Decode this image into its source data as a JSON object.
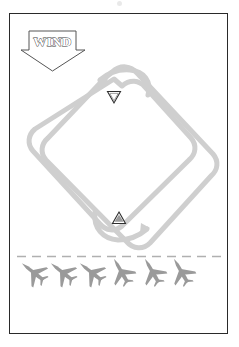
{
  "figure": {
    "kind": "aircraft-traffic-pattern-diagram",
    "caption": "",
    "background_color": "#ffffff",
    "border_color": "#2a2a2a",
    "path_color": "#cfcfcf",
    "aircraft_color": "#9a9a9a",
    "runway_color": "#b0b0b0",
    "marker_color": "#3a3a3a"
  },
  "wind_indicator": {
    "label": "WIND",
    "direction": "down",
    "outline_color": "#555555",
    "fill_color": "#ffffff",
    "text_style": "outline"
  },
  "flight_path": {
    "name": "rectangular-traffic-pattern",
    "stroke_width": 5,
    "legs": [
      "upwind",
      "crosswind",
      "downwind",
      "base",
      "final"
    ],
    "arrows": [
      {
        "name": "upper-turn-arrow",
        "direction": "left"
      },
      {
        "name": "lower-turn-arrow",
        "direction": "right"
      }
    ]
  },
  "markers": [
    {
      "name": "downwind-marker",
      "shape": "triangle-down",
      "x": 114,
      "y": 97
    },
    {
      "name": "upwind-marker",
      "shape": "triangle-up",
      "x": 119,
      "y": 218
    }
  ],
  "runway": {
    "name": "runway-centerline",
    "style": "dashed",
    "y": 256
  },
  "aircraft": [
    {
      "id": 1,
      "x": 33,
      "y": 272,
      "rotation": -52
    },
    {
      "id": 2,
      "x": 62,
      "y": 272,
      "rotation": -52
    },
    {
      "id": 3,
      "x": 91,
      "y": 272,
      "rotation": -52
    },
    {
      "id": 4,
      "x": 121,
      "y": 271,
      "rotation": -30
    },
    {
      "id": 5,
      "x": 152,
      "y": 271,
      "rotation": -30
    },
    {
      "id": 6,
      "x": 181,
      "y": 271,
      "rotation": -30
    }
  ]
}
